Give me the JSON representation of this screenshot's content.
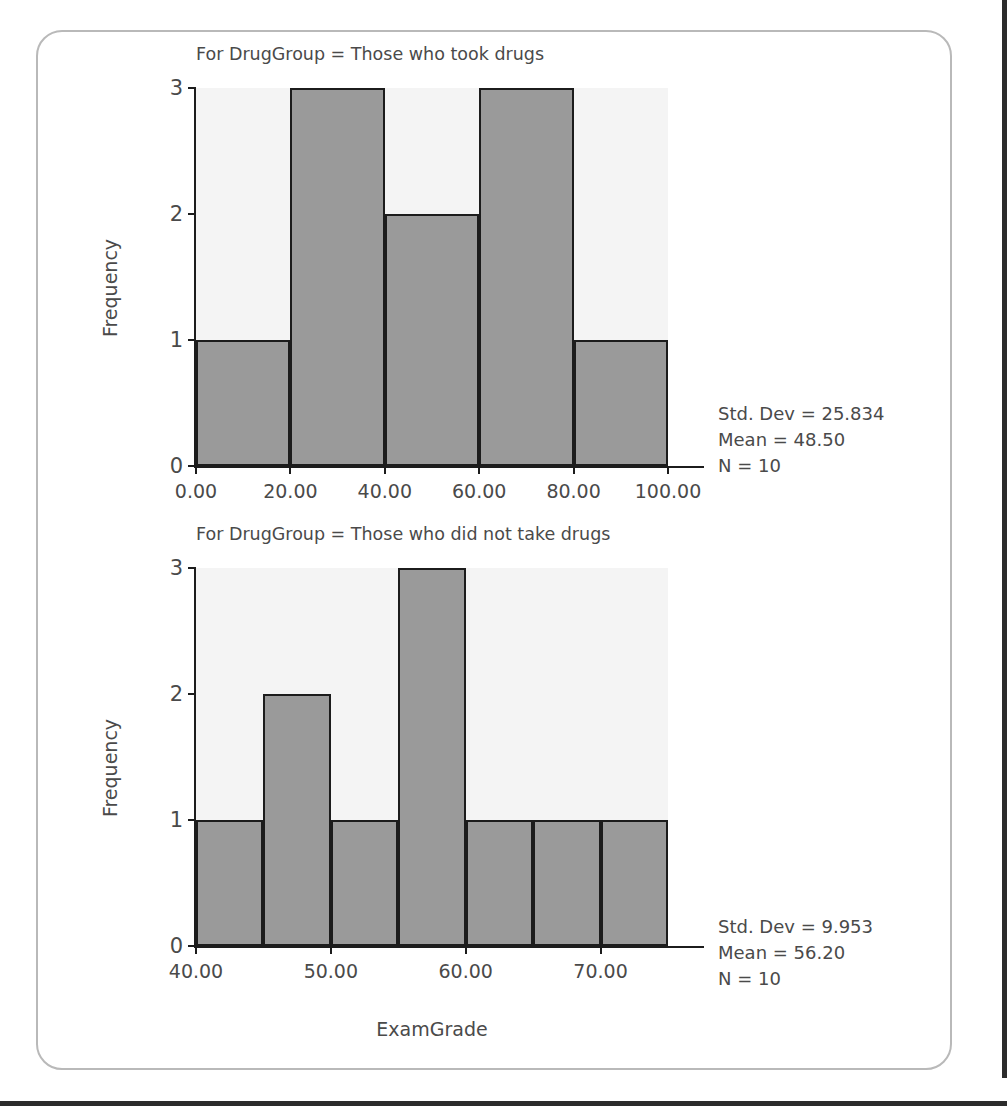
{
  "figure": {
    "variable": "ExamGrade",
    "split_by": "DrugGroup",
    "y_axis_label": "Frequency",
    "x_axis_label": "ExamGrade",
    "bar_color": "#9a9a9a",
    "bar_edge_color": "#1c1c1c",
    "plot_background": "#f4f4f4",
    "text_color": "#4a4a4a"
  },
  "chart_data": [
    {
      "type": "bar",
      "id": "histogram-took-drugs",
      "title": "For DrugGroup = Those who took drugs",
      "xlabel": "",
      "ylabel": "Frequency",
      "xlim": [
        0,
        100
      ],
      "ylim": [
        0,
        3
      ],
      "xticks": [
        0,
        20,
        40,
        60,
        80,
        100
      ],
      "xtick_labels": [
        "0.00",
        "20.00",
        "40.00",
        "60.00",
        "80.00",
        "100.00"
      ],
      "yticks": [
        0,
        1,
        2,
        3
      ],
      "ytick_labels": [
        "0",
        "1",
        "2",
        "3"
      ],
      "grid": false,
      "legend": "none",
      "bin_width": 20,
      "bin_edges": [
        0,
        20,
        40,
        60,
        80,
        100
      ],
      "categories": [
        "0-20",
        "20-40",
        "40-60",
        "60-80",
        "80-100"
      ],
      "values": [
        1,
        3,
        2,
        3,
        1
      ],
      "annotations": {
        "std_dev": "Std. Dev = 25.834",
        "mean": "Mean = 48.50",
        "n": "N = 10"
      }
    },
    {
      "type": "bar",
      "id": "histogram-no-drugs",
      "title": "For DrugGroup = Those who did not take drugs",
      "xlabel": "ExamGrade",
      "ylabel": "Frequency",
      "xlim": [
        40,
        75
      ],
      "ylim": [
        0,
        3
      ],
      "xticks": [
        40,
        50,
        60,
        70
      ],
      "xtick_labels": [
        "40.00",
        "50.00",
        "60.00",
        "70.00"
      ],
      "yticks": [
        0,
        1,
        2,
        3
      ],
      "ytick_labels": [
        "0",
        "1",
        "2",
        "3"
      ],
      "grid": false,
      "legend": "none",
      "bin_width": 5,
      "bin_edges": [
        40,
        45,
        50,
        55,
        60,
        65,
        70,
        75
      ],
      "categories": [
        "40-45",
        "45-50",
        "50-55",
        "55-60",
        "60-65",
        "65-70",
        "70-75"
      ],
      "values": [
        1,
        2,
        1,
        3,
        1,
        1,
        1
      ],
      "annotations": {
        "std_dev": "Std. Dev = 9.953",
        "mean": "Mean = 56.20",
        "n": "N = 10"
      }
    }
  ]
}
